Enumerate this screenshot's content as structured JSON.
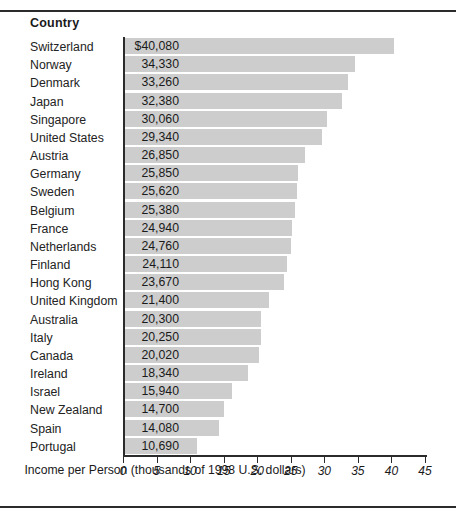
{
  "figure": {
    "column_header": "Country"
  },
  "chart_data": {
    "type": "bar",
    "orientation": "horizontal",
    "title": "",
    "subtitle": "",
    "xlabel": "Income per Person (thousands of 1998 U.S. dollars)",
    "ylabel": "Country",
    "xlim": [
      0,
      45
    ],
    "xticks": [
      0,
      5,
      10,
      15,
      20,
      25,
      30,
      35,
      40,
      45
    ],
    "xtick_labels": [
      "0",
      "5",
      "10",
      "15",
      "20",
      "25",
      "30",
      "35",
      "40",
      "45"
    ],
    "grid": false,
    "legend": null,
    "bar_color": "#cdcdcd",
    "axis_color": "#2b2b2b",
    "value_units": "1998 U.S. dollars per person",
    "categories": [
      "Switzerland",
      "Norway",
      "Denmark",
      "Japan",
      "Singapore",
      "United States",
      "Austria",
      "Germany",
      "Sweden",
      "Belgium",
      "France",
      "Netherlands",
      "Finland",
      "Hong Kong",
      "United Kingdom",
      "Australia",
      "Italy",
      "Canada",
      "Ireland",
      "Israel",
      "New Zealand",
      "Spain",
      "Portugal"
    ],
    "values": [
      40080,
      34330,
      33260,
      32380,
      30060,
      29340,
      26850,
      25850,
      25620,
      25380,
      24940,
      24760,
      24110,
      23670,
      21400,
      20300,
      20250,
      20020,
      18340,
      15940,
      14700,
      14080,
      10690
    ],
    "value_labels": [
      "$40,080",
      "34,330",
      "33,260",
      "32,380",
      "30,060",
      "29,340",
      "26,850",
      "25,850",
      "25,620",
      "25,380",
      "24,940",
      "24,760",
      "24,110",
      "23,670",
      "21,400",
      "20,300",
      "20,250",
      "20,020",
      "18,340",
      "15,940",
      "14,700",
      "14,080",
      "10,690"
    ]
  }
}
